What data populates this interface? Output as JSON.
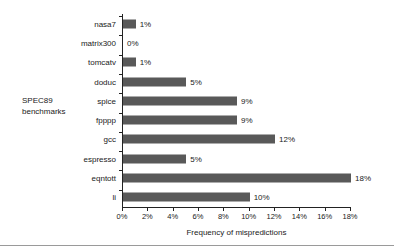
{
  "chart_data": {
    "type": "bar",
    "orientation": "horizontal",
    "title": "",
    "xlabel": "Frequency of mispredictions",
    "ylabel": "SPEC89\nbenchmarks",
    "categories": [
      "nasa7",
      "matrix300",
      "tomcatv",
      "doduc",
      "spice",
      "fpppp",
      "gcc",
      "espresso",
      "eqntott",
      "li"
    ],
    "values": [
      1,
      0,
      1,
      5,
      9,
      9,
      12,
      5,
      18,
      10
    ],
    "value_labels": [
      "1%",
      "0%",
      "1%",
      "5%",
      "9%",
      "9%",
      "12%",
      "5%",
      "18%",
      "10%"
    ],
    "xlim": [
      0,
      18
    ],
    "xticks": [
      0,
      2,
      4,
      6,
      8,
      10,
      12,
      14,
      16,
      18
    ],
    "xtick_labels": [
      "0%",
      "2%",
      "4%",
      "6%",
      "8%",
      "10%",
      "12%",
      "14%",
      "16%",
      "18%"
    ],
    "grid": false,
    "legend": null,
    "bar_color": "#595959",
    "axis_color": "#222222",
    "text_color": "#1a1a1a"
  }
}
